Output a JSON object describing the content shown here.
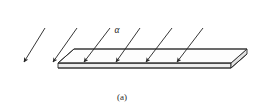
{
  "figure": {
    "caption": "(a)",
    "angle_label": "α",
    "background_color": "#ffffff",
    "line_color": "#2b2b2b",
    "plate_face_color": "#fdfdfd",
    "plate_edge_color": "#ededed",
    "canvas": {
      "width": 269,
      "height": 112
    }
  },
  "plate": {
    "name": "flat-plate",
    "top_face": "58,63 74,49 247,49 231,63",
    "thickness_px": 5,
    "front_edge_left_x": 58,
    "front_edge_right_x": 231,
    "front_edge_y": 63,
    "back_edge_left_x": 74,
    "back_edge_right_x": 247,
    "back_edge_y": 49
  },
  "rays": {
    "count": 6,
    "direction": "down-right",
    "items": [
      {
        "name": "incident-ray-1",
        "x1": 45,
        "y1": 28,
        "x2": 24,
        "y2": 62
      },
      {
        "name": "incident-ray-2",
        "x1": 77,
        "y1": 28,
        "x2": 53,
        "y2": 62
      },
      {
        "name": "incident-ray-3",
        "x1": 110,
        "y1": 28,
        "x2": 84,
        "y2": 62
      },
      {
        "name": "incident-ray-4",
        "x1": 140,
        "y1": 28,
        "x2": 116,
        "y2": 62
      },
      {
        "name": "incident-ray-5",
        "x1": 172,
        "y1": 28,
        "x2": 146,
        "y2": 62
      },
      {
        "name": "incident-ray-6",
        "x1": 203,
        "y1": 28,
        "x2": 177,
        "y2": 62
      }
    ]
  },
  "label_positions": {
    "angle_label_x": 117,
    "angle_label_y": 33,
    "caption_x": 122,
    "caption_y": 100
  }
}
